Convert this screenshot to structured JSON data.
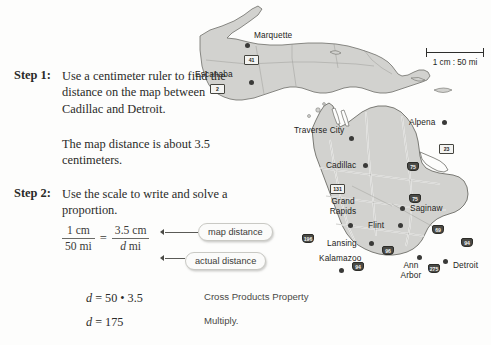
{
  "lesson": {
    "step1": {
      "label": "Step 1:",
      "body": "Use a centimeter ruler to find the distance on the map between Cadillac and Detroit.",
      "note": "The map distance is about 3.5 centimeters."
    },
    "step2": {
      "label": "Step 2:",
      "body": "Use the scale to write and solve a proportion."
    },
    "proportion": {
      "left_numerator": "1 cm",
      "left_denominator": "50 mi",
      "equals": "=",
      "right_numerator": "3.5 cm",
      "right_denominator_var": "d",
      "right_denominator_unit": "mi",
      "callout_map": "map distance",
      "callout_actual": "actual distance"
    },
    "equations": [
      {
        "expression": "d = 50 • 3.5",
        "reason": "Cross Products Property"
      },
      {
        "expression": "d = 175",
        "reason": "Multiply."
      }
    ]
  },
  "map": {
    "scale": {
      "text": "1 cm : 50 mi"
    },
    "cities": [
      {
        "name": "Marquette"
      },
      {
        "name": "Escanaba"
      },
      {
        "name": "Traverse City"
      },
      {
        "name": "Alpena"
      },
      {
        "name": "Cadillac"
      },
      {
        "name": "Grand",
        "name2": "Rapids"
      },
      {
        "name": "Saginaw"
      },
      {
        "name": "Flint"
      },
      {
        "name": "Lansing"
      },
      {
        "name": "Kalamazoo"
      },
      {
        "name": "Ann",
        "name2": "Arbor"
      },
      {
        "name": "Detroit"
      }
    ],
    "routes": [
      {
        "id": "41",
        "type": "us"
      },
      {
        "id": "2",
        "type": "us"
      },
      {
        "id": "23",
        "type": "us"
      },
      {
        "id": "131",
        "type": "us"
      },
      {
        "id": "75",
        "type": "interstate"
      },
      {
        "id": "75",
        "type": "interstate"
      },
      {
        "id": "196",
        "type": "interstate"
      },
      {
        "id": "96",
        "type": "interstate"
      },
      {
        "id": "69",
        "type": "interstate"
      },
      {
        "id": "94",
        "type": "interstate"
      },
      {
        "id": "94",
        "type": "interstate"
      },
      {
        "id": "275",
        "type": "interstate"
      }
    ],
    "colors": {
      "land": "#d2d2cf",
      "outline": "#6d6d68",
      "water": "#fdfdfc",
      "road": "#ffffff",
      "dot": "#3a3a38"
    }
  }
}
